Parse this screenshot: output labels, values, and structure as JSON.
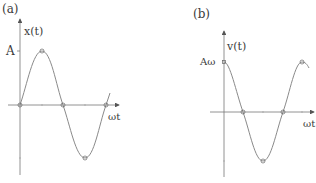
{
  "panels": [
    {
      "id": "a",
      "label": "(a)",
      "y_axis_label": "x(t)",
      "x_axis_label": "ωt",
      "amplitude_label": "A",
      "function": "x(t) = A sin(ωt)"
    },
    {
      "id": "b",
      "label": "(b)",
      "y_axis_label": "v(t)",
      "x_axis_label": "ωt",
      "amplitude_label": "Aω",
      "function": "v(t) = Aω cos(ωt)"
    }
  ],
  "colors": {
    "curve": "#8a8a8a",
    "axis": "#6a6a6a",
    "text": "#3a3a3a"
  }
}
